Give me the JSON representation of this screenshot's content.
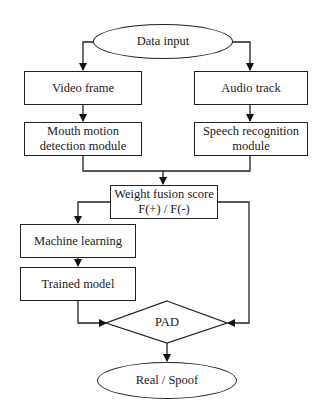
{
  "diagram": {
    "type": "flowchart",
    "nodes": {
      "data_input": {
        "label": "Data input",
        "shape": "ellipse"
      },
      "video_frame": {
        "label": "Video frame",
        "shape": "rect"
      },
      "audio_track": {
        "label": "Audio track",
        "shape": "rect"
      },
      "mouth_motion": {
        "line1": "Mouth motion",
        "line2": "detection module",
        "shape": "rect"
      },
      "speech_recognition": {
        "line1": "Speech recognition",
        "line2": "module",
        "shape": "rect"
      },
      "weight_fusion": {
        "line1": "Weight fusion score",
        "line2": "F(+) / F(-)",
        "shape": "rect"
      },
      "machine_learning": {
        "label": "Machine learning",
        "shape": "rect"
      },
      "trained_model": {
        "label": "Trained model",
        "shape": "rect"
      },
      "pad": {
        "label": "PAD",
        "shape": "diamond"
      },
      "real_spoof": {
        "label": "Real / Spoof",
        "shape": "ellipse"
      }
    },
    "edges": [
      [
        "data_input",
        "video_frame"
      ],
      [
        "data_input",
        "audio_track"
      ],
      [
        "video_frame",
        "mouth_motion"
      ],
      [
        "audio_track",
        "speech_recognition"
      ],
      [
        "mouth_motion",
        "weight_fusion"
      ],
      [
        "speech_recognition",
        "weight_fusion"
      ],
      [
        "weight_fusion",
        "machine_learning"
      ],
      [
        "weight_fusion",
        "pad"
      ],
      [
        "machine_learning",
        "trained_model"
      ],
      [
        "trained_model",
        "pad"
      ],
      [
        "pad",
        "real_spoof"
      ]
    ]
  }
}
